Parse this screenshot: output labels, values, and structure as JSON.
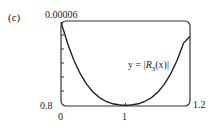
{
  "figure": {
    "panel_label": "(c)",
    "curve_label_prefix": "y = |",
    "curve_label_fn": "R",
    "curve_label_sub": "3",
    "curve_label_arg": "(x)|"
  },
  "axes": {
    "y_max_label": "0.00006",
    "y_min_label": "0",
    "x_min_label": "0.8",
    "x_mid_label": "1",
    "x_max_label": "1.2"
  },
  "colors": {
    "curve": "#222222",
    "axes": "#333333"
  },
  "chart_data": {
    "type": "line",
    "title": "",
    "panel": "(c)",
    "xlabel": "",
    "ylabel": "",
    "xlim": [
      0.8,
      1.2
    ],
    "ylim": [
      0,
      6e-05
    ],
    "x_ticks": [
      0.8,
      1,
      1.2
    ],
    "y_ticks_labeled": [
      0,
      6e-05
    ],
    "y_minor_ticks": 5,
    "grid": false,
    "legend": null,
    "annotations": [
      "y = |R3(x)|"
    ],
    "series": [
      {
        "name": "y = |R3(x)|",
        "x": [
          0.8,
          0.82,
          0.84,
          0.86,
          0.88,
          0.9,
          0.92,
          0.94,
          0.96,
          0.98,
          1.0,
          1.02,
          1.04,
          1.06,
          1.08,
          1.1,
          1.12,
          1.14,
          1.16,
          1.18,
          1.2
        ],
        "y": [
          5.88e-05,
          4.4e-05,
          3.18e-05,
          2.22e-05,
          1.48e-05,
          9.3e-06,
          5.4e-06,
          2.8e-06,
          1.2e-06,
          4e-07,
          0.0,
          4e-07,
          1.2e-06,
          2.8e-06,
          5.4e-06,
          9.3e-06,
          1.48e-05,
          2.22e-05,
          3.18e-05,
          4.4e-05,
          4.88e-05
        ]
      }
    ]
  }
}
